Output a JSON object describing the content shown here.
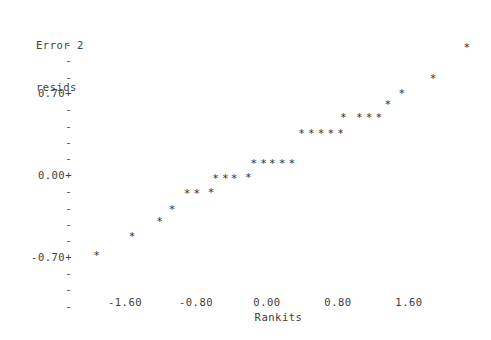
{
  "chart_data": {
    "type": "scatter",
    "title": "Error 2 resids",
    "ylabel": "Error 2 resids",
    "xlabel": "Rankits",
    "grid": false,
    "legend": null,
    "xlim": [
      -2.05,
      2.05
    ],
    "ylim": [
      -1.16,
      1.3
    ],
    "xticks": [
      -1.6,
      -0.8,
      0.0,
      0.8,
      1.6
    ],
    "xtick_labels": [
      "-1.60",
      "-0.80",
      "0.00",
      "0.80",
      "1.60"
    ],
    "yticks": [
      0.7,
      0.0,
      -0.7
    ],
    "ytick_labels": [
      "0.70+",
      "0.00+",
      "-0.70+"
    ],
    "marker": "*",
    "points": [
      {
        "x": -1.92,
        "y": -1.02
      },
      {
        "x": -1.52,
        "y": -0.82
      },
      {
        "x": -1.21,
        "y": -0.66
      },
      {
        "x": -1.07,
        "y": -0.53
      },
      {
        "x": -0.9,
        "y": -0.36
      },
      {
        "x": -0.79,
        "y": -0.36
      },
      {
        "x": -0.63,
        "y": -0.35
      },
      {
        "x": -0.58,
        "y": -0.2
      },
      {
        "x": -0.47,
        "y": -0.2
      },
      {
        "x": -0.37,
        "y": -0.2
      },
      {
        "x": -0.21,
        "y": -0.19
      },
      {
        "x": -0.15,
        "y": -0.05
      },
      {
        "x": -0.04,
        "y": -0.05
      },
      {
        "x": 0.06,
        "y": -0.05
      },
      {
        "x": 0.17,
        "y": -0.05
      },
      {
        "x": 0.28,
        "y": -0.05
      },
      {
        "x": 0.39,
        "y": 0.27
      },
      {
        "x": 0.5,
        "y": 0.27
      },
      {
        "x": 0.61,
        "y": 0.27
      },
      {
        "x": 0.72,
        "y": 0.27
      },
      {
        "x": 0.83,
        "y": 0.27
      },
      {
        "x": 0.86,
        "y": 0.44
      },
      {
        "x": 1.04,
        "y": 0.44
      },
      {
        "x": 1.15,
        "y": 0.44
      },
      {
        "x": 1.26,
        "y": 0.44
      },
      {
        "x": 1.36,
        "y": 0.57
      },
      {
        "x": 1.52,
        "y": 0.69
      },
      {
        "x": 1.87,
        "y": 0.85
      },
      {
        "x": 2.25,
        "y": 1.17
      }
    ]
  },
  "axes": {
    "y_title_line1": "Error 2",
    "y_title_line2": "resids",
    "y_labels": [
      {
        "text": "-",
        "value": null
      },
      {
        "text": "-",
        "value": null
      },
      {
        "text": "-",
        "value": null
      },
      {
        "text": "0.70+",
        "value": 0.7
      },
      {
        "text": "-",
        "value": null
      },
      {
        "text": "-",
        "value": null
      },
      {
        "text": "-",
        "value": null
      },
      {
        "text": "-",
        "value": null
      },
      {
        "text": "0.00+",
        "value": 0.0
      },
      {
        "text": "-",
        "value": null
      },
      {
        "text": "-",
        "value": null
      },
      {
        "text": "-",
        "value": null
      },
      {
        "text": "-",
        "value": null
      },
      {
        "text": "-0.70+",
        "value": -0.7
      },
      {
        "text": "-",
        "value": null
      },
      {
        "text": "-",
        "value": null
      },
      {
        "text": "-",
        "value": null
      }
    ],
    "x_axis_line": "+---------+---------+---------+---------+---------+-------",
    "x_labels": [
      "-1.60",
      "-0.80",
      "0.00",
      "0.80",
      "1.60"
    ],
    "x_title": "Rankits"
  },
  "style": {
    "background": "#ffffff",
    "ink": "#3d3d3d",
    "marker_color": "#2d2d2d"
  }
}
